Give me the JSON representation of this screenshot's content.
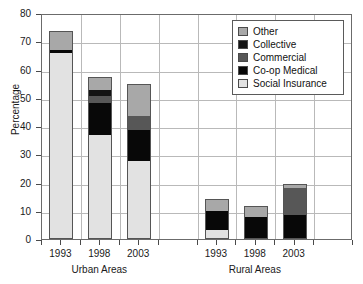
{
  "chart_data": {
    "type": "bar",
    "title": "",
    "xlabel": "",
    "ylabel": "Percentage",
    "ylim": [
      0,
      80
    ],
    "ytick_values": [
      "0",
      "10",
      "20",
      "30",
      "40",
      "50",
      "60",
      "70",
      "80"
    ],
    "grid": true,
    "stacked": true,
    "legend_position": "top-right",
    "categories": [
      "1993",
      "1998",
      "2003",
      "1993",
      "1998",
      "2003"
    ],
    "groups": [
      {
        "name": "Urban Areas",
        "categories": [
          "1993",
          "1998",
          "2003"
        ]
      },
      {
        "name": "Rural Areas",
        "categories": [
          "1993",
          "1998",
          "2003"
        ]
      }
    ],
    "series": [
      {
        "name": "Social Insurance",
        "color": "#e2e2e2",
        "values": [
          65.8,
          36.8,
          27.6,
          3.3,
          0.5,
          0.0
        ]
      },
      {
        "name": "Co-op Medical",
        "color": "#080808",
        "values": [
          1.1,
          11.2,
          11.0,
          6.7,
          7.3,
          8.5
        ]
      },
      {
        "name": "Commercial",
        "color": "#575757",
        "values": [
          0.0,
          2.5,
          5.1,
          0.0,
          0.0,
          9.4
        ]
      },
      {
        "name": "Collective",
        "color": "#141414",
        "values": [
          0.0,
          2.4,
          0.0,
          0.0,
          0.0,
          0.0
        ]
      },
      {
        "name": "Other",
        "color": "#a8a8a8",
        "values": [
          6.6,
          4.4,
          11.2,
          4.3,
          3.9,
          1.4
        ]
      }
    ],
    "bar_totals": [
      73.5,
      57.3,
      54.9,
      14.3,
      11.7,
      19.3
    ],
    "legend_entries": [
      {
        "label": "Other",
        "color": "#a8a8a8"
      },
      {
        "label": "Collective",
        "color": "#141414"
      },
      {
        "label": "Commercial",
        "color": "#575757"
      },
      {
        "label": "Co-op Medical",
        "color": "#080808"
      },
      {
        "label": "Social Insurance",
        "color": "#e2e2e2"
      }
    ]
  }
}
